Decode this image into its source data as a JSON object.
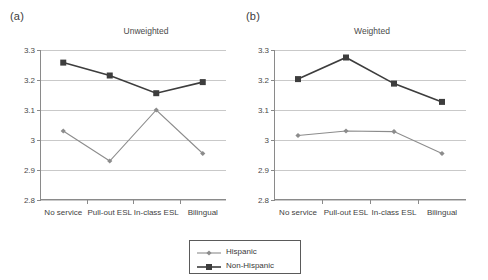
{
  "figure": {
    "panels": [
      {
        "panel_label": "(a)",
        "title": "Unweighted"
      },
      {
        "panel_label": "(b)",
        "title": "Weighted"
      }
    ]
  },
  "legend": {
    "position": "bottom-center",
    "entries": [
      {
        "label": "Hispanic",
        "color": "#8c8c8c",
        "marker": "diamond"
      },
      {
        "label": "Non-Hispanic",
        "color": "#3d3d3d",
        "marker": "square"
      }
    ]
  },
  "chart_data": [
    {
      "type": "line",
      "panel": "(a)",
      "title": "Unweighted",
      "xlabel": "",
      "ylabel": "",
      "categories": [
        "No service",
        "Pull-out ESL",
        "In-class ESL",
        "Bilingual"
      ],
      "yticks": [
        "3.3",
        "3.2",
        "3.1",
        "3",
        "2.9",
        "2.8"
      ],
      "ytick_values": [
        3.3,
        3.2,
        3.1,
        3.0,
        2.9,
        2.8
      ],
      "ylim": [
        2.8,
        3.3
      ],
      "grid": true,
      "series": [
        {
          "name": "Hispanic",
          "color": "#8c8c8c",
          "marker": "diamond",
          "values": [
            3.03,
            2.93,
            3.1,
            2.955
          ]
        },
        {
          "name": "Non-Hispanic",
          "color": "#3d3d3d",
          "marker": "square",
          "values": [
            3.258,
            3.215,
            3.156,
            3.193
          ]
        }
      ]
    },
    {
      "type": "line",
      "panel": "(b)",
      "title": "Weighted",
      "xlabel": "",
      "ylabel": "",
      "categories": [
        "No service",
        "Pull-out ESL",
        "In-class ESL",
        "Bilingual"
      ],
      "yticks": [
        "3.3",
        "3.2",
        "3.1",
        "3",
        "2.9",
        "2.8"
      ],
      "ytick_values": [
        3.3,
        3.2,
        3.1,
        3.0,
        2.9,
        2.8
      ],
      "ylim": [
        2.8,
        3.3
      ],
      "grid": true,
      "series": [
        {
          "name": "Hispanic",
          "color": "#8c8c8c",
          "marker": "diamond",
          "values": [
            3.015,
            3.03,
            3.028,
            2.955
          ]
        },
        {
          "name": "Non-Hispanic",
          "color": "#3d3d3d",
          "marker": "square",
          "values": [
            3.203,
            3.275,
            3.188,
            3.127
          ]
        }
      ]
    }
  ]
}
